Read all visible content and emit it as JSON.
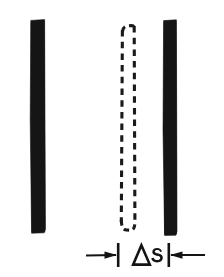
{
  "figure": {
    "title": "Gap spacing diagram",
    "description": "Two solid vertical bars with a dashed outline bar between them and a horizontal dimension annotation below",
    "background_color": "#ffffff",
    "ink_color": "#151515",
    "width": 224,
    "height": 277
  },
  "elements": {
    "left_bar": {
      "label": "left solid bar",
      "style": "solid filled",
      "x": 30,
      "y": 20,
      "width": 15,
      "height": 213,
      "color": "#151515"
    },
    "dashed_bar": {
      "label": "dashed outline bar",
      "style": "dashed outline",
      "x": 121,
      "y": 24,
      "width": 14,
      "height": 206,
      "color": "#1a1a1a"
    },
    "right_bar": {
      "label": "right solid bar",
      "style": "solid filled",
      "x": 163,
      "y": 20,
      "width": 14,
      "height": 215,
      "color": "#151515"
    }
  },
  "dimension": {
    "label_symbol": "Δs",
    "delta_glyph": "Δ",
    "variable_glyph": "s",
    "arrow_left_direction": "right",
    "arrow_right_direction": "left",
    "baseline_y": 255,
    "left_extension_x": 118,
    "right_extension_x": 168,
    "left_arrow_start_x": 86,
    "right_arrow_end_x": 205
  }
}
